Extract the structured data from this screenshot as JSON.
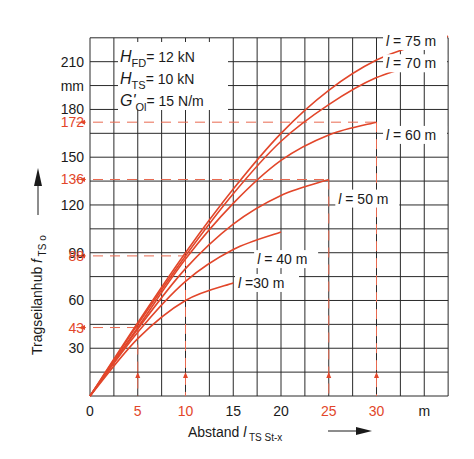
{
  "chart_data": {
    "type": "line",
    "title": "",
    "xlabel": "Abstand l_TS St-x",
    "xlabel_main": "Abstand",
    "xlabel_sym": "l",
    "xlabel_sub": "TS St-x",
    "x_unit": "m",
    "ylabel": "Tragseilanhub f_TS o",
    "ylabel_main": "Tragseilanhub",
    "ylabel_sym": "f",
    "ylabel_sub": "TS o",
    "y_unit": "mm",
    "xlim": [
      0,
      37.5
    ],
    "ylim": [
      0,
      225
    ],
    "grid": true,
    "x_ticks": [
      "0",
      "5",
      "10",
      "15",
      "20",
      "25",
      "30"
    ],
    "x_ticks_highlighted": [
      "5",
      "10",
      "25",
      "30"
    ],
    "y_ticks": [
      "30",
      "60",
      "90",
      "120",
      "150",
      "180",
      "210"
    ],
    "y_ticks_highlighted": [
      "43",
      "88",
      "136",
      "172"
    ],
    "parameters": [
      {
        "sym": "H",
        "sub": "FD",
        "value": "= 12 kN"
      },
      {
        "sym": "H",
        "sub": "TS",
        "value": "= 10 kN"
      },
      {
        "sym": "G'",
        "sub": "Ol",
        "value": "= 15 N/m"
      }
    ],
    "series": [
      {
        "name": "l = 30 m",
        "label": "=30 m",
        "x": [
          0,
          5,
          10,
          15
        ],
        "values": [
          0,
          36,
          60,
          71
        ]
      },
      {
        "name": "l = 40 m",
        "label": "= 40 m",
        "x": [
          0,
          5,
          10,
          15,
          20
        ],
        "values": [
          0,
          40,
          72,
          92,
          103
        ]
      },
      {
        "name": "l = 50 m",
        "label": "= 50 m",
        "x": [
          0,
          5,
          10,
          15,
          20,
          25
        ],
        "values": [
          0,
          42,
          80,
          108,
          126,
          136
        ]
      },
      {
        "name": "l = 60 m",
        "label": "= 60 m",
        "x": [
          0,
          5,
          10,
          15,
          20,
          25,
          30
        ],
        "values": [
          0,
          43,
          86,
          121,
          148,
          164,
          172
        ]
      },
      {
        "name": "l = 70 m",
        "label": "= 70 m",
        "x": [
          0,
          5,
          10,
          15,
          20,
          25,
          30,
          35
        ],
        "values": [
          0,
          45,
          88,
          127,
          160,
          183,
          200,
          209
        ]
      },
      {
        "name": "l = 75 m",
        "label": "= 75 m",
        "x": [
          0,
          5,
          10,
          15,
          20,
          25,
          30,
          35,
          37.5
        ],
        "values": [
          0,
          46,
          90,
          130,
          165,
          192,
          211,
          222,
          226
        ]
      }
    ],
    "annotations": [
      {
        "x": 5,
        "y": 43,
        "note": "dashed reading line"
      },
      {
        "x": 10,
        "y": 88,
        "note": "dashed reading line"
      },
      {
        "x": 25,
        "y": 136,
        "note": "dashed reading line"
      },
      {
        "x": 30,
        "y": 172,
        "note": "dashed reading line"
      }
    ]
  },
  "colors": {
    "curve": "#e2462a",
    "highlight_text": "#e2462a",
    "grid": "#2a2a2a",
    "text": "#1a1a1a"
  }
}
